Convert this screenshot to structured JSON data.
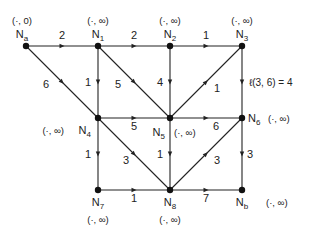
{
  "diagram": {
    "type": "directed-weighted-graph",
    "colors": {
      "line": "#222222",
      "node": "#111111",
      "text": "#222222"
    },
    "nodes": [
      {
        "id": "Na",
        "name": "N",
        "sub": "a",
        "label": "(·, 0)",
        "x": 26,
        "y": 46
      },
      {
        "id": "N1",
        "name": "N",
        "sub": "1",
        "label": "(·, ∞)",
        "x": 98,
        "y": 46
      },
      {
        "id": "N2",
        "name": "N",
        "sub": "2",
        "label": "(·, ∞)",
        "x": 170,
        "y": 46
      },
      {
        "id": "N3",
        "name": "N",
        "sub": "3",
        "label": "(·, ∞)",
        "x": 242,
        "y": 46
      },
      {
        "id": "N4",
        "name": "N",
        "sub": "4",
        "label": "(·, ∞)",
        "x": 98,
        "y": 118
      },
      {
        "id": "N5",
        "name": "N",
        "sub": "5",
        "label": "(·, ∞)",
        "x": 170,
        "y": 118
      },
      {
        "id": "N6",
        "name": "N",
        "sub": "6",
        "label": "(·, ∞)",
        "x": 242,
        "y": 118
      },
      {
        "id": "N7",
        "name": "N",
        "sub": "7",
        "label": "(·, ∞)",
        "x": 98,
        "y": 190
      },
      {
        "id": "N8",
        "name": "N",
        "sub": "8",
        "label": "(·, ∞)",
        "x": 170,
        "y": 190
      },
      {
        "id": "Nb",
        "name": "N",
        "sub": "b",
        "label": "(·, ∞)",
        "x": 242,
        "y": 190
      }
    ],
    "edges": [
      {
        "from": "Na",
        "to": "N1",
        "w": "2"
      },
      {
        "from": "N1",
        "to": "N2",
        "w": "2"
      },
      {
        "from": "N2",
        "to": "N3",
        "w": "1"
      },
      {
        "from": "Na",
        "to": "N4",
        "w": "6"
      },
      {
        "from": "N1",
        "to": "N4",
        "w": "1"
      },
      {
        "from": "N1",
        "to": "N5",
        "w": "5"
      },
      {
        "from": "N2",
        "to": "N5",
        "w": "4"
      },
      {
        "from": "N5",
        "to": "N3",
        "w": "1"
      },
      {
        "from": "N3",
        "to": "N6",
        "w": "ℓ(3, 6) = 4"
      },
      {
        "from": "N4",
        "to": "N5",
        "w": "5"
      },
      {
        "from": "N5",
        "to": "N6",
        "w": "6"
      },
      {
        "from": "N4",
        "to": "N7",
        "w": "1"
      },
      {
        "from": "N4",
        "to": "N8",
        "w": "3"
      },
      {
        "from": "N5",
        "to": "N8",
        "w": "1"
      },
      {
        "from": "N8",
        "to": "N6",
        "w": "3"
      },
      {
        "from": "N6",
        "to": "Nb",
        "w": "3"
      },
      {
        "from": "N7",
        "to": "N8",
        "w": "1"
      },
      {
        "from": "N8",
        "to": "Nb",
        "w": "7"
      }
    ]
  }
}
